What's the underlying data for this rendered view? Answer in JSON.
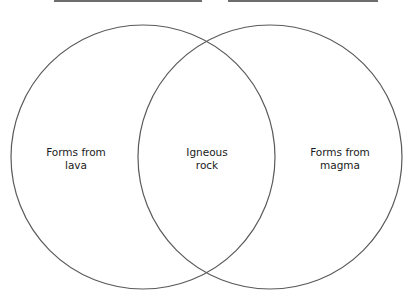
{
  "title_blanks": [
    {
      "name": "left-title-blank",
      "x": 54,
      "width": 148
    },
    {
      "name": "right-title-blank",
      "x": 228,
      "width": 150
    }
  ],
  "diagram": {
    "type": "venn",
    "stroke_color": "#5a5a5a",
    "circles": [
      {
        "name": "left",
        "cx": 143,
        "cy": 157,
        "r": 132
      },
      {
        "name": "right",
        "cx": 270,
        "cy": 157,
        "r": 132
      }
    ],
    "labels": {
      "left": {
        "line1": "Forms from",
        "line2": "lava"
      },
      "center": {
        "line1": "Igneous",
        "line2": "rock"
      },
      "right": {
        "line1": "Forms from",
        "line2": "magma"
      }
    }
  }
}
